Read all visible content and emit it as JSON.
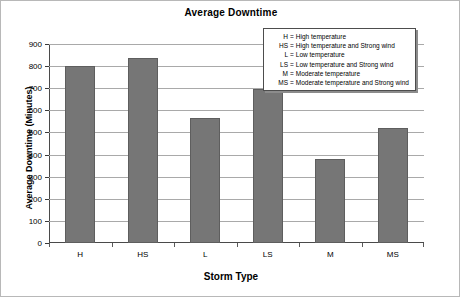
{
  "chart_data": {
    "type": "bar",
    "title": "Average Downtime",
    "xlabel": "Storm Type",
    "ylabel": "Average Downtime (Minutes)",
    "categories": [
      "H",
      "HS",
      "L",
      "LS",
      "M",
      "MS"
    ],
    "values": [
      800,
      838,
      565,
      695,
      380,
      520
    ],
    "ylim": [
      0,
      900
    ],
    "ytick_values": [
      900,
      800,
      700,
      600,
      500,
      400,
      300,
      200,
      100,
      0
    ],
    "ytick_labels": [
      "900",
      "800",
      "700",
      "600",
      "500",
      "400",
      "300",
      "200",
      "100",
      "0"
    ],
    "grid": true,
    "legend_position": "upper-right",
    "series_color": "#767676",
    "legend_entries": [
      {
        "abbr": "H",
        "eq": "=",
        "desc": "High temperature"
      },
      {
        "abbr": "HS",
        "eq": "=",
        "desc": "High temperature and Strong wind"
      },
      {
        "abbr": "L",
        "eq": "=",
        "desc": "Low temperature"
      },
      {
        "abbr": "LS",
        "eq": "=",
        "desc": "Low temperature and Strong wind"
      },
      {
        "abbr": "M",
        "eq": "=",
        "desc": "Moderate temperature"
      },
      {
        "abbr": "MS",
        "eq": "=",
        "desc": "Moderate temperature and Strong wind"
      }
    ]
  }
}
